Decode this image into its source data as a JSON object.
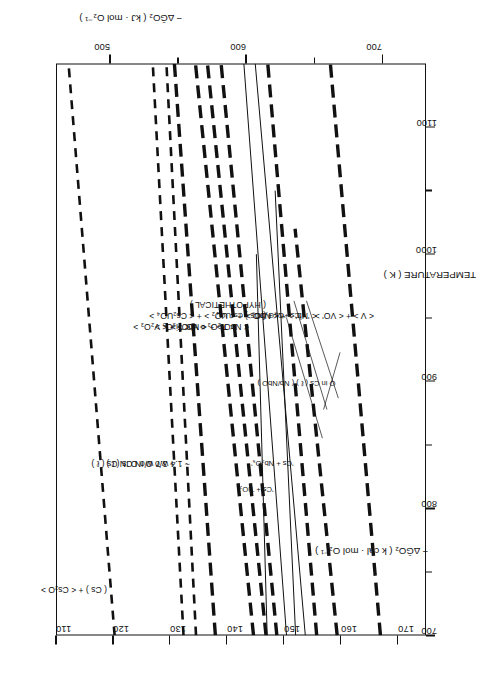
{
  "figure": {
    "axes": {
      "x": {
        "label": "TEMPERATURE ( K )",
        "min": 700,
        "max": 1150,
        "major_ticks": [
          700,
          800,
          900,
          1000,
          1100
        ],
        "minor_ticks": [
          750,
          850,
          950,
          1050
        ],
        "tick_labels": [
          "700",
          "800",
          "900",
          "1000",
          "1100"
        ]
      },
      "y_primary": {
        "label": "− ΔḠO₂ ( k cal · mol O₂⁻¹ )",
        "label_plain": "- dG O2 (k cal . mol O2^-1)",
        "units": "kcal/mol O2",
        "min": 110,
        "max": 175,
        "major_ticks": [
          110,
          120,
          130,
          140,
          150,
          160,
          170
        ],
        "tick_labels": [
          "110",
          "120",
          "130",
          "140",
          "150",
          "160",
          "170"
        ]
      },
      "y_secondary": {
        "label": "− ΔḠO₂ ( kJ · mol O₂⁻¹ )",
        "label_plain": "- dG O2 (kJ . mol O2^-1)",
        "units": "kJ/mol O2",
        "min": 460,
        "max": 732,
        "major_ticks": [
          500,
          600,
          700
        ],
        "minor_ticks": [
          550,
          650
        ],
        "tick_labels": [
          "500",
          "600",
          "700"
        ]
      }
    }
  },
  "chart_data": {
    "type": "line",
    "title": "",
    "xlabel": "TEMPERATURE ( K )",
    "ylabel": "− ΔḠO₂ ( k cal · mol O₂⁻¹ )",
    "xlim": [
      700,
      1150
    ],
    "ylim": [
      110,
      175
    ],
    "y2label": "− ΔḠO₂ ( kJ · mol O₂⁻¹ )",
    "y2lim": [
      460,
      732
    ],
    "grid": false,
    "legend": "inline-labels",
    "series": [
      {
        "name": "(Cs) + <Cs2O>",
        "label": "( Cs ) + < Cs₂O >",
        "style": "dashed",
        "weight": "medium",
        "x": [
          700,
          1150
        ],
        "y": [
          120.3,
          112.2
        ]
      },
      {
        "name": "~3.7 w/o O IN Cs(l)",
        "label": "~ 3.7 w/o O IN Cs ( ℓ )",
        "style": "dashed",
        "weight": "medium",
        "x": [
          700,
          1150
        ],
        "y": [
          132.4,
          127.0
        ]
      },
      {
        "name": "~1.4 w/o O IN Cs(l)",
        "label": "~ 1.4 w/o O IN Cs ( ℓ )",
        "style": "dashed",
        "weight": "medium",
        "x": [
          700,
          1150
        ],
        "y": [
          134.6,
          129.4
        ]
      },
      {
        "name": "<VO'> + <V2O3>",
        "label": "< VO' > + < V₂O₃ >",
        "style": "dashed",
        "weight": "heavy",
        "x": [
          700,
          1150
        ],
        "y": [
          138.0,
          130.8
        ]
      },
      {
        "name": "<Ti2O3> + <Ti3O5>",
        "label": "< Ti₂O₃ > + < Ti₃O₅ >",
        "style": "dashed",
        "weight": "heavy",
        "x": [
          700,
          1150
        ],
        "y": [
          144.7,
          134.5
        ]
      },
      {
        "name": "<NbO> + <NbO2>",
        "label": "< NbO > + < NbO₂ >",
        "style": "dashed",
        "weight": "heavy",
        "x": [
          700,
          1150
        ],
        "y": [
          146.9,
          136.6
        ]
      },
      {
        "name": "(Cs) + <UO2> + <Cs2UO4> (HYPOTHETICAL)",
        "label": "( Cs ) + < UO₂ > + < Cs₂UO₄ >",
        "sublabel": "( HYPOTHETICAL )",
        "style": "dashed",
        "weight": "heavy",
        "x": [
          700,
          1150
        ],
        "y": [
          148.8,
          139.0
        ]
      },
      {
        "name": "'Cs + TiO2'",
        "label": "'Cs + TiO₂'",
        "style": "solid",
        "weight": "thin",
        "x": [
          700,
          1000
        ],
        "y": [
          147.1,
          145.2
        ]
      },
      {
        "name": "'Cs + UO2 + Cs2UO4'",
        "label": "'Cs + UO₂ + Cs₂UO₄'",
        "style": "solid",
        "weight": "thin",
        "x": [
          700,
          1150
        ],
        "y": [
          150.5,
          143.0
        ]
      },
      {
        "name": "'Cs + Nb2O5'",
        "label": "'Cs + Nb₂O₅'",
        "style": "solid",
        "weight": "thin",
        "x": [
          700,
          1050
        ],
        "y": [
          152.1,
          148.5
        ]
      },
      {
        "name": "'Cs + V2O3'",
        "label": "'Cs + V₂O₃'",
        "style": "solid",
        "weight": "thin",
        "x": [
          700,
          1150
        ],
        "y": [
          153.8,
          145.0
        ]
      },
      {
        "name": "<'Nb'> + <NbO>",
        "label": "< 'Nb' > + < NbO >",
        "style": "dashed",
        "weight": "heavy",
        "x": [
          700,
          1150
        ],
        "y": [
          155.8,
          147.2
        ]
      },
      {
        "name": "O in Cs(l) (Nb/NbO)",
        "label": "O in Cs ( ℓ ) ( Nb/NbO )",
        "style": "dashed",
        "weight": "heavy",
        "x": [
          700,
          1020
        ],
        "y": [
          159.4,
          152.0
        ]
      },
      {
        "name": "<V> + <VO'>",
        "label": "< V > + < VO' >",
        "style": "dashed",
        "weight": "heavy",
        "x": [
          700,
          1150
        ],
        "y": [
          167.0,
          158.2
        ]
      }
    ]
  }
}
